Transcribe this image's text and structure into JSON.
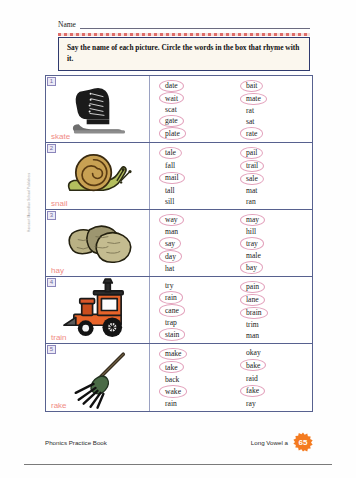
{
  "header": {
    "name_label": "Name",
    "instruction": "Say the name of each picture. Circle the words in the box that rhyme with it."
  },
  "margin_credit": "Harcourt  Macmillan School Publishers",
  "items": [
    {
      "number": "1",
      "picture": "ice-skate",
      "label": "skate",
      "left_column": [
        {
          "text": "date",
          "circled": true
        },
        {
          "text": "wait",
          "circled": true
        },
        {
          "text": "scat",
          "circled": false
        },
        {
          "text": "gate",
          "circled": true
        },
        {
          "text": "plate",
          "circled": true
        }
      ],
      "right_column": [
        {
          "text": "bait",
          "circled": true
        },
        {
          "text": "mate",
          "circled": true
        },
        {
          "text": "rat",
          "circled": false
        },
        {
          "text": "sat",
          "circled": false
        },
        {
          "text": "rate",
          "circled": true
        }
      ]
    },
    {
      "number": "2",
      "picture": "snail",
      "label": "snail",
      "left_column": [
        {
          "text": "tale",
          "circled": true
        },
        {
          "text": "fall",
          "circled": false
        },
        {
          "text": "mail",
          "circled": true
        },
        {
          "text": "tall",
          "circled": false
        },
        {
          "text": "sill",
          "circled": false
        }
      ],
      "right_column": [
        {
          "text": "pail",
          "circled": true
        },
        {
          "text": "trail",
          "circled": true
        },
        {
          "text": "sale",
          "circled": true
        },
        {
          "text": "mat",
          "circled": false
        },
        {
          "text": "ran",
          "circled": false
        }
      ]
    },
    {
      "number": "3",
      "picture": "hay-bales",
      "label": "hay",
      "left_column": [
        {
          "text": "way",
          "circled": true
        },
        {
          "text": "man",
          "circled": false
        },
        {
          "text": "say",
          "circled": true
        },
        {
          "text": "day",
          "circled": true
        },
        {
          "text": "hat",
          "circled": false
        }
      ],
      "right_column": [
        {
          "text": "may",
          "circled": true
        },
        {
          "text": "hill",
          "circled": false
        },
        {
          "text": "tray",
          "circled": true
        },
        {
          "text": "male",
          "circled": false
        },
        {
          "text": "bay",
          "circled": true
        }
      ]
    },
    {
      "number": "4",
      "picture": "train",
      "label": "train",
      "left_column": [
        {
          "text": "try",
          "circled": false
        },
        {
          "text": "rain",
          "circled": true
        },
        {
          "text": "cane",
          "circled": true
        },
        {
          "text": "trap",
          "circled": false
        },
        {
          "text": "stain",
          "circled": true
        }
      ],
      "right_column": [
        {
          "text": "pain",
          "circled": true
        },
        {
          "text": "lane",
          "circled": true
        },
        {
          "text": "brain",
          "circled": true
        },
        {
          "text": "trim",
          "circled": false
        },
        {
          "text": "man",
          "circled": false
        }
      ]
    },
    {
      "number": "5",
      "picture": "rake",
      "label": "rake",
      "left_column": [
        {
          "text": "make",
          "circled": true
        },
        {
          "text": "take",
          "circled": true
        },
        {
          "text": "back",
          "circled": false
        },
        {
          "text": "wake",
          "circled": true
        },
        {
          "text": "rain",
          "circled": false
        }
      ],
      "right_column": [
        {
          "text": "okay",
          "circled": false
        },
        {
          "text": "bake",
          "circled": true
        },
        {
          "text": "raid",
          "circled": false
        },
        {
          "text": "fake",
          "circled": true
        },
        {
          "text": "ray",
          "circled": false
        }
      ]
    }
  ],
  "footer": {
    "book_title": "Phonics Practice Book",
    "chapter": "Long Vowel a",
    "page_number": "65"
  },
  "colors": {
    "instruction_border": "#2f3a6e",
    "instruction_bg": "#fbf7ee",
    "table_border": "#57618f",
    "label_pink": "#f08a84",
    "circle_pink": "#e3a3bd",
    "badge_orange": "#f47b20",
    "deco_red": "#d9534f"
  }
}
